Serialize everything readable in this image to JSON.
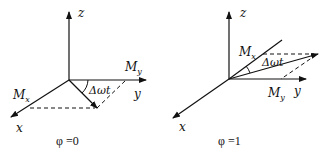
{
  "diagrams": [
    {
      "id": "left",
      "caption": "φ =0",
      "axes": {
        "z": "z",
        "y": "y",
        "x": "x"
      },
      "labels": {
        "mx_main": "M",
        "mx_sub": "x",
        "my_main": "M",
        "my_sub": "y",
        "angle": "Δωt"
      }
    },
    {
      "id": "right",
      "caption": "φ =1",
      "axes": {
        "z": "z",
        "y": "y",
        "x": "x"
      },
      "labels": {
        "mx_main": "M",
        "mx_sub": "x",
        "my_main": "M",
        "my_sub": "y",
        "angle": "Δωt"
      }
    }
  ],
  "colors": {
    "stroke": "#111111",
    "background": "#ffffff"
  }
}
